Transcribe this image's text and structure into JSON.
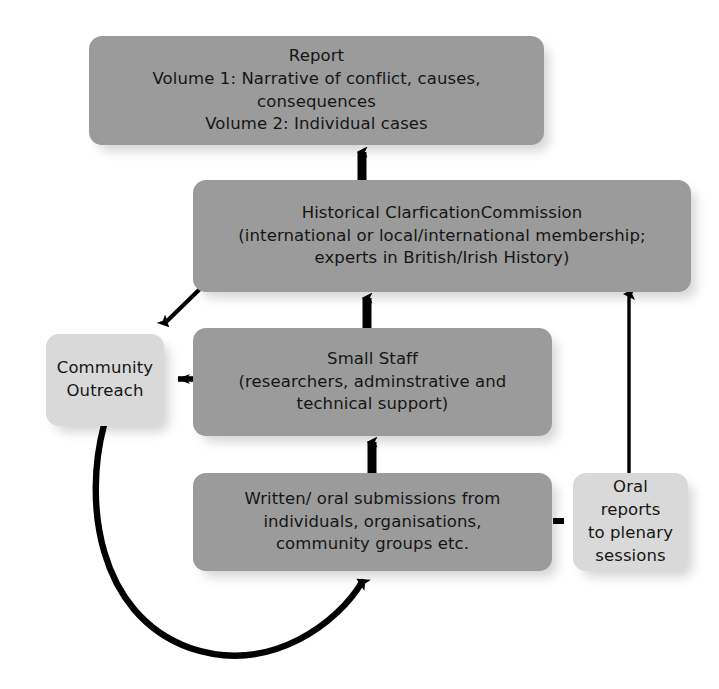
{
  "diagram": {
    "type": "flowchart",
    "canvas": {
      "width": 719,
      "height": 689,
      "background": "#ffffff"
    },
    "palette": {
      "node_dark": "#9b9b9b",
      "node_light": "#d9d9d9",
      "edge": "#000000",
      "text": "#151515"
    },
    "nodes": [
      {
        "id": "report",
        "text": "Report\nVolume 1: Narrative of conflict, causes, consequences\nVolume 2: Individual cases",
        "fill": "#9b9b9b",
        "shade": "dark"
      },
      {
        "id": "commission",
        "text": "Historical ClarficationCommission\n(international or local/international membership;\nexperts in British/Irish History)",
        "fill": "#9b9b9b",
        "shade": "dark"
      },
      {
        "id": "staff",
        "text": "Small Staff\n(researchers, adminstrative and\ntechnical support)",
        "fill": "#9b9b9b",
        "shade": "dark"
      },
      {
        "id": "submissions",
        "text": "Written/ oral submissions from\nindividuals, organisations,\ncommunity groups etc.",
        "fill": "#9b9b9b",
        "shade": "dark"
      },
      {
        "id": "outreach",
        "text": "Community\nOutreach",
        "fill": "#d9d9d9",
        "shade": "light"
      },
      {
        "id": "plenary",
        "text": "Oral reports\nto plenary\nsessions",
        "fill": "#d9d9d9",
        "shade": "light"
      }
    ],
    "edges": [
      {
        "id": "commission-to-report",
        "from": "commission",
        "to": "report",
        "style": "thick-solid",
        "direction": "up"
      },
      {
        "id": "staff-to-commission",
        "from": "staff",
        "to": "commission",
        "style": "thick-solid",
        "direction": "up"
      },
      {
        "id": "submissions-to-staff",
        "from": "submissions",
        "to": "staff",
        "style": "thick-solid",
        "direction": "up"
      },
      {
        "id": "commission-to-outreach",
        "from": "commission",
        "to": "outreach",
        "style": "thin-solid",
        "direction": "diagonal-down-left"
      },
      {
        "id": "staff-to-outreach",
        "from": "staff",
        "to": "outreach",
        "style": "medium-solid",
        "direction": "left"
      },
      {
        "id": "plenary-to-commission",
        "from": "plenary",
        "to": "commission",
        "style": "thin-solid",
        "direction": "up"
      },
      {
        "id": "submissions-to-plenary",
        "from": "submissions",
        "to": "plenary",
        "style": "dashed",
        "direction": "none"
      },
      {
        "id": "outreach-to-submissions",
        "from": "outreach",
        "to": "submissions",
        "style": "thick-curve",
        "direction": "curved-up-right"
      }
    ]
  }
}
